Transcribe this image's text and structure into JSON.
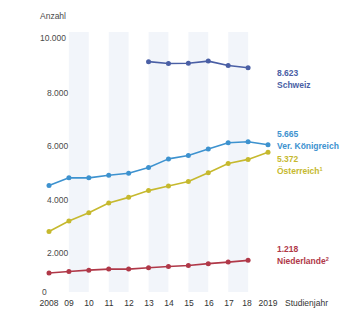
{
  "chart_data": {
    "type": "line",
    "title": "",
    "ylabel": "Anzahl",
    "xlabel": "Studienjahr",
    "ylim": [
      0,
      10000
    ],
    "yticks": [
      0,
      2000,
      4000,
      6000,
      8000,
      10000
    ],
    "ytick_labels": [
      "0",
      "2.000",
      "4.000",
      "6.000",
      "8.000",
      "10.000"
    ],
    "grid": "vertical-bands",
    "legend_position": "right",
    "x": [
      2008,
      2009,
      2010,
      2011,
      2012,
      2013,
      2014,
      2015,
      2016,
      2017,
      2018,
      2019
    ],
    "xtick_labels": [
      "2008",
      "09",
      "10",
      "11",
      "12",
      "13",
      "14",
      "15",
      "16",
      "17",
      "18",
      "2019"
    ],
    "series": [
      {
        "name": "Schweiz",
        "end_value_label": "8.623",
        "color": "#4a5fa5",
        "x": [
          2013,
          2014,
          2015,
          2016,
          2017,
          2018
        ],
        "values": [
          8860,
          8790,
          8800,
          8880,
          8710,
          8623
        ]
      },
      {
        "name": "Ver. Königreich",
        "end_value_label": "5.665",
        "color": "#3d92cf",
        "x": [
          2008,
          2009,
          2010,
          2011,
          2012,
          2013,
          2014,
          2015,
          2016,
          2017,
          2018,
          2019
        ],
        "values": [
          4100,
          4390,
          4390,
          4490,
          4570,
          4790,
          5120,
          5250,
          5500,
          5740,
          5780,
          5665
        ]
      },
      {
        "name": "Österreich",
        "name_superscript": "1",
        "end_value_label": "5.372",
        "color": "#c6b92e",
        "x": [
          2008,
          2009,
          2010,
          2011,
          2012,
          2013,
          2014,
          2015,
          2016,
          2017,
          2018,
          2019
        ],
        "values": [
          2330,
          2730,
          3050,
          3420,
          3640,
          3900,
          4080,
          4250,
          4590,
          4940,
          5100,
          5372
        ]
      },
      {
        "name": "Niederlande",
        "name_superscript": "2",
        "end_value_label": "1.218",
        "color": "#b03848",
        "x": [
          2008,
          2009,
          2010,
          2011,
          2012,
          2013,
          2014,
          2015,
          2016,
          2017,
          2018
        ],
        "values": [
          730,
          790,
          840,
          880,
          880,
          930,
          980,
          1020,
          1090,
          1150,
          1218
        ]
      }
    ]
  },
  "labels": {
    "schweiz_value": "8.623",
    "schweiz_name": "Schweiz",
    "uk_value": "5.665",
    "uk_name": "Ver. Königreich",
    "at_value": "5.372",
    "at_name": "Österreich",
    "at_sup": "1",
    "nl_value": "1.218",
    "nl_name": "Niederlande",
    "nl_sup": "2"
  },
  "axes": {
    "y_title": "Anzahl",
    "x_title": "Studienjahr",
    "y_10000": "10.000",
    "y_8000": "8.000",
    "y_6000": "6.000",
    "y_4000": "4.000",
    "y_2000": "2.000",
    "y_0": "0",
    "x_2008": "2008",
    "x_09": "09",
    "x_10": "10",
    "x_11": "11",
    "x_12": "12",
    "x_13": "13",
    "x_14": "14",
    "x_15": "15",
    "x_16": "16",
    "x_17": "17",
    "x_18": "18",
    "x_2019": "2019"
  },
  "colors": {
    "schweiz": "#4a5fa5",
    "uk": "#3d92cf",
    "oesterreich": "#c6b92e",
    "niederlande": "#b03848",
    "band": "#e8ecf5",
    "text": "#4a4a4a"
  }
}
